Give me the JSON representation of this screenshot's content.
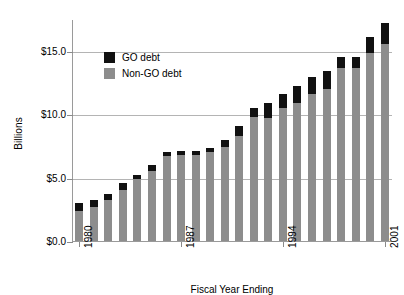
{
  "chart_data": {
    "type": "bar",
    "subtype": "stacked-vertical",
    "title": "",
    "xlabel": "Fiscal Year Ending",
    "ylabel": "Billions",
    "ylim": [
      0,
      17.5
    ],
    "grid": true,
    "grid_axis": "y",
    "legend_position": "upper-left-inside",
    "categories": [
      "1980",
      "1981",
      "1982",
      "1983",
      "1984",
      "1985",
      "1986",
      "1987",
      "1988",
      "1989",
      "1990",
      "1991",
      "1992",
      "1993",
      "1994",
      "1995",
      "1996",
      "1997",
      "1998",
      "1999",
      "2000",
      "2001"
    ],
    "x_tick_labels_shown": [
      "1980",
      "1987",
      "1994",
      "2001"
    ],
    "y_tick_labels": [
      "$0.0",
      "$5.0",
      "$10.0",
      "$15.0"
    ],
    "y_tick_values": [
      0.0,
      5.0,
      10.0,
      15.0
    ],
    "series": [
      {
        "name": "Non-GO debt",
        "color": "#8d8d8d",
        "values": [
          2.4,
          2.7,
          3.2,
          4.0,
          4.9,
          5.5,
          6.7,
          6.8,
          6.8,
          7.0,
          7.4,
          8.3,
          9.8,
          9.7,
          10.5,
          10.9,
          11.6,
          12.0,
          13.6,
          13.6,
          14.8,
          15.5
        ]
      },
      {
        "name": "GO debt",
        "color": "#111111",
        "values": [
          0.6,
          0.5,
          0.5,
          0.6,
          0.3,
          0.5,
          0.3,
          0.3,
          0.3,
          0.3,
          0.6,
          0.8,
          0.7,
          1.2,
          1.1,
          1.3,
          1.3,
          1.4,
          0.9,
          0.9,
          1.3,
          1.7
        ]
      }
    ],
    "totals": [
      3.0,
      3.2,
      3.7,
      4.6,
      5.2,
      6.0,
      7.0,
      7.1,
      7.1,
      7.3,
      8.0,
      9.1,
      10.5,
      10.9,
      11.6,
      12.2,
      12.9,
      13.4,
      14.5,
      14.5,
      16.1,
      17.2
    ]
  },
  "legend": {
    "items": [
      {
        "label": "GO debt",
        "swatch": "black-square-swatch"
      },
      {
        "label": "Non-GO debt",
        "swatch": "gray-square-swatch"
      }
    ]
  },
  "axes": {
    "y_title": "Billions",
    "x_title": "Fiscal Year Ending"
  }
}
